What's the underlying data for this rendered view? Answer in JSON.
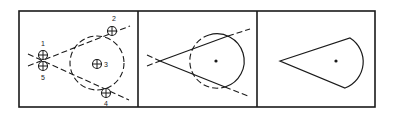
{
  "figure": {
    "panel_count": 3,
    "stroke_color": "#1a1a1a",
    "background": "#ffffff",
    "panels": [
      {
        "id": "panel-1",
        "description": "Construction points with dashed guide lines and dashed circle",
        "markers": [
          {
            "label": "1",
            "x": 43,
            "y": 55
          },
          {
            "label": "2",
            "x": 112,
            "y": 31
          },
          {
            "label": "3",
            "x": 97,
            "y": 64
          },
          {
            "label": "4",
            "x": 106,
            "y": 93
          },
          {
            "label": "5",
            "x": 43,
            "y": 66
          }
        ]
      },
      {
        "id": "panel-2",
        "description": "Tangent lines from apex to circle, solid segments with dashed extensions"
      },
      {
        "id": "panel-3",
        "description": "Resulting cone/teardrop shape with center point"
      }
    ]
  }
}
